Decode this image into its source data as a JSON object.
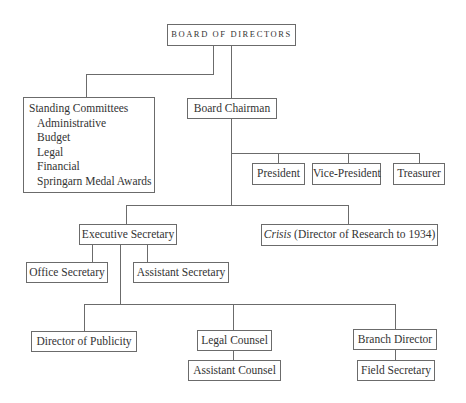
{
  "org_chart": {
    "root": {
      "label": "BOARD OF DIRECTORS"
    },
    "standing_committees": {
      "title": "Standing Committees",
      "items": [
        "Administrative",
        "Budget",
        "Legal",
        "Financial",
        "Springarn Medal Awards"
      ]
    },
    "board_chairman": {
      "label": "Board Chairman"
    },
    "officers": [
      {
        "label": "President"
      },
      {
        "label": "Vice-President"
      },
      {
        "label": "Treasurer"
      }
    ],
    "executive_secretary": {
      "label": "Executive Secretary"
    },
    "crisis": {
      "italic_label": "Crisis",
      "label": " (Director of Research to 1934)"
    },
    "secretaries": [
      {
        "label": "Office Secretary"
      },
      {
        "label": "Assistant Secretary"
      }
    ],
    "departments": [
      {
        "label": "Director of Publicity"
      },
      {
        "label": "Legal Counsel",
        "child": "Assistant Counsel"
      },
      {
        "label": "Branch Director",
        "child": "Field Secretary"
      }
    ]
  }
}
